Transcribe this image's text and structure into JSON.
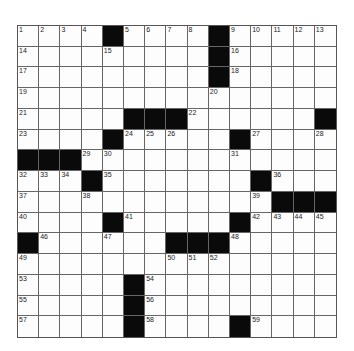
{
  "puzzle": {
    "size": {
      "rows": 15,
      "cols": 15
    },
    "rows": [
      "....#....#.....",
      ".........#.....",
      ".........#.....",
      "...............",
      ".....###......#",
      "....#.....#....",
      "###............",
      "...#.......#...",
      "............###",
      "....#.....#....",
      "#......###.....",
      "...............",
      ".....#.........",
      ".....#.........",
      ".....#....#...."
    ],
    "numbers": [
      {
        "r": 0,
        "c": 0,
        "n": "1"
      },
      {
        "r": 0,
        "c": 1,
        "n": "2"
      },
      {
        "r": 0,
        "c": 2,
        "n": "3"
      },
      {
        "r": 0,
        "c": 3,
        "n": "4"
      },
      {
        "r": 0,
        "c": 5,
        "n": "5"
      },
      {
        "r": 0,
        "c": 6,
        "n": "6"
      },
      {
        "r": 0,
        "c": 7,
        "n": "7"
      },
      {
        "r": 0,
        "c": 8,
        "n": "8"
      },
      {
        "r": 0,
        "c": 10,
        "n": "9"
      },
      {
        "r": 0,
        "c": 11,
        "n": "10"
      },
      {
        "r": 0,
        "c": 12,
        "n": "11"
      },
      {
        "r": 0,
        "c": 13,
        "n": "12"
      },
      {
        "r": 0,
        "c": 14,
        "n": "13"
      },
      {
        "r": 1,
        "c": 0,
        "n": "14"
      },
      {
        "r": 1,
        "c": 4,
        "n": "15"
      },
      {
        "r": 1,
        "c": 10,
        "n": "16"
      },
      {
        "r": 2,
        "c": 0,
        "n": "17"
      },
      {
        "r": 2,
        "c": 10,
        "n": "18"
      },
      {
        "r": 3,
        "c": 0,
        "n": "19"
      },
      {
        "r": 3,
        "c": 9,
        "n": "20"
      },
      {
        "r": 4,
        "c": 0,
        "n": "21"
      },
      {
        "r": 4,
        "c": 8,
        "n": "22"
      },
      {
        "r": 5,
        "c": 0,
        "n": "23"
      },
      {
        "r": 5,
        "c": 5,
        "n": "24"
      },
      {
        "r": 5,
        "c": 6,
        "n": "25"
      },
      {
        "r": 5,
        "c": 7,
        "n": "26"
      },
      {
        "r": 5,
        "c": 11,
        "n": "27"
      },
      {
        "r": 5,
        "c": 14,
        "n": "28"
      },
      {
        "r": 6,
        "c": 3,
        "n": "29"
      },
      {
        "r": 6,
        "c": 4,
        "n": "30"
      },
      {
        "r": 6,
        "c": 10,
        "n": "31"
      },
      {
        "r": 7,
        "c": 0,
        "n": "32"
      },
      {
        "r": 7,
        "c": 1,
        "n": "33"
      },
      {
        "r": 7,
        "c": 2,
        "n": "34"
      },
      {
        "r": 7,
        "c": 4,
        "n": "35"
      },
      {
        "r": 7,
        "c": 12,
        "n": "36"
      },
      {
        "r": 8,
        "c": 0,
        "n": "37"
      },
      {
        "r": 8,
        "c": 3,
        "n": "38"
      },
      {
        "r": 8,
        "c": 11,
        "n": "39"
      },
      {
        "r": 9,
        "c": 0,
        "n": "40"
      },
      {
        "r": 9,
        "c": 5,
        "n": "41"
      },
      {
        "r": 9,
        "c": 11,
        "n": "42"
      },
      {
        "r": 9,
        "c": 12,
        "n": "43"
      },
      {
        "r": 9,
        "c": 13,
        "n": "44"
      },
      {
        "r": 9,
        "c": 14,
        "n": "45"
      },
      {
        "r": 10,
        "c": 1,
        "n": "46"
      },
      {
        "r": 10,
        "c": 4,
        "n": "47"
      },
      {
        "r": 10,
        "c": 10,
        "n": "48"
      },
      {
        "r": 11,
        "c": 0,
        "n": "49"
      },
      {
        "r": 11,
        "c": 7,
        "n": "50"
      },
      {
        "r": 11,
        "c": 8,
        "n": "51"
      },
      {
        "r": 11,
        "c": 9,
        "n": "52"
      },
      {
        "r": 12,
        "c": 0,
        "n": "53"
      },
      {
        "r": 12,
        "c": 6,
        "n": "54"
      },
      {
        "r": 13,
        "c": 0,
        "n": "55"
      },
      {
        "r": 13,
        "c": 6,
        "n": "56"
      },
      {
        "r": 14,
        "c": 0,
        "n": "57"
      },
      {
        "r": 14,
        "c": 6,
        "n": "58"
      },
      {
        "r": 14,
        "c": 11,
        "n": "59"
      }
    ]
  },
  "colors": {
    "block": "#0a0a0a",
    "cell": "#fdfdfd",
    "line": "#666666"
  }
}
